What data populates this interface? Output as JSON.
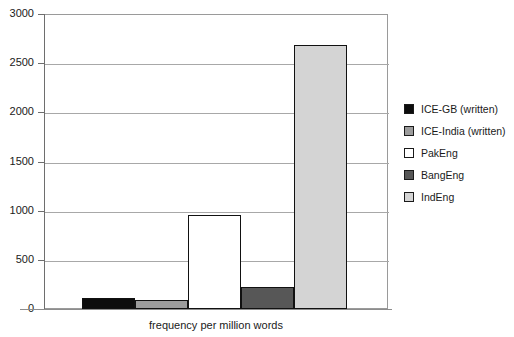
{
  "chart_data": {
    "type": "bar",
    "title": "",
    "xlabel": "frequency per million words",
    "ylabel": "",
    "categories": [
      "ICE-GB (written)",
      "ICE-India (written)",
      "PakEng",
      "BangEng",
      "IndEng"
    ],
    "values": [
      115,
      95,
      960,
      225,
      2685
    ],
    "ylim": [
      0,
      3000
    ],
    "yticks": [
      0,
      500,
      1000,
      1500,
      2000,
      2500,
      3000
    ],
    "ytick_labels": [
      "0",
      "500",
      "1000",
      "1500",
      "2000",
      "2500",
      "3000"
    ],
    "grid": true,
    "legend_position": "right",
    "colors": [
      "#0d0d0d",
      "#9c9c9c",
      "#ffffff",
      "#575757",
      "#d4d4d4"
    ],
    "bar_edge_color": "#111111"
  },
  "legend": {
    "items": [
      {
        "label": "ICE-GB (written)",
        "color": "#0d0d0d"
      },
      {
        "label": "ICE-India (written)",
        "color": "#9c9c9c"
      },
      {
        "label": "PakEng",
        "color": "#ffffff"
      },
      {
        "label": "BangEng",
        "color": "#575757"
      },
      {
        "label": "IndEng",
        "color": "#d4d4d4"
      }
    ]
  }
}
